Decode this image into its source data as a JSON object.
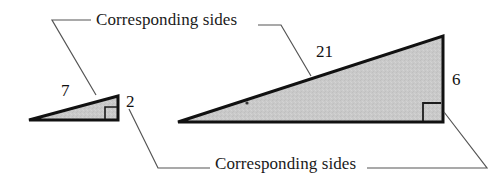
{
  "figure": {
    "kind": "similar-right-triangles-diagram",
    "callouts": {
      "top_label": "Corresponding sides",
      "bottom_label": "Corresponding sides"
    },
    "small_triangle": {
      "hypotenuse_label": "7",
      "vertical_side_label": "2",
      "right_angle_marker": "right-angle-square"
    },
    "large_triangle": {
      "hypotenuse_label": "21",
      "vertical_side_label": "6",
      "right_angle_marker": "right-angle-square"
    },
    "colors": {
      "fill": "#c9c9c9",
      "outline": "#111111",
      "leader_line": "#555555",
      "text": "#1a1a1a"
    }
  }
}
